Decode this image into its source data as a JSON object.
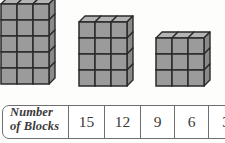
{
  "page": {
    "background_color": "#fdfdfc"
  },
  "illustration": {
    "description": "Three isometric stacks of cubes arranged left to right, decreasing in height",
    "block_face_color": "#9b9b9b",
    "block_side_color": "#8a8a8a",
    "block_top_color": "#b4b4b4",
    "block_outline_color": "#2a2a2a",
    "stacks": [
      {
        "name": "stack-15",
        "columns": 3,
        "rows": 5,
        "count": 15,
        "clipped_top": true
      },
      {
        "name": "stack-12",
        "columns": 3,
        "rows": 4,
        "count": 12,
        "clipped_top": false
      },
      {
        "name": "stack-9",
        "columns": 3,
        "rows": 3,
        "count": 9,
        "clipped_top": false
      }
    ]
  },
  "table": {
    "row_label_line1": "Number",
    "row_label_line2": "of Blocks",
    "values": [
      "15",
      "12",
      "9",
      "6",
      "3"
    ],
    "border_color": "#6f6f6f",
    "text_color": "#3a3a38"
  }
}
